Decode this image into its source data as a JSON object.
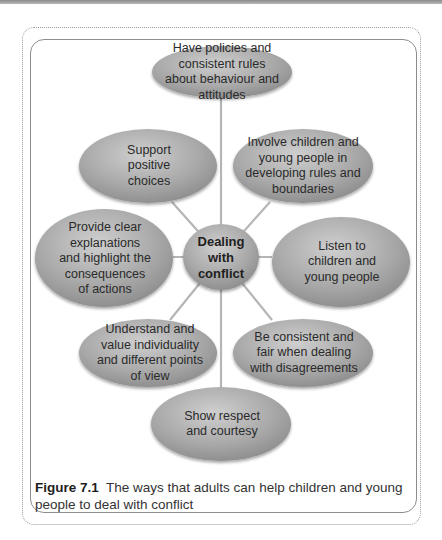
{
  "diagram": {
    "center": {
      "label": "Dealing with conflict"
    },
    "nodes": [
      {
        "id": "top",
        "label": "Have policies and consistent rules about behaviour and attitudes"
      },
      {
        "id": "upper-right",
        "label": "Involve children and young people in developing rules and boundaries"
      },
      {
        "id": "right",
        "label": "Listen to children and young people"
      },
      {
        "id": "lower-right",
        "label": "Be consistent and fair when dealing with disagreements"
      },
      {
        "id": "bottom",
        "label": "Show respect and courtesy"
      },
      {
        "id": "lower-left",
        "label": "Understand and value individuality and different points of view"
      },
      {
        "id": "left",
        "label": "Provide clear explanations and highlight the consequences of actions"
      },
      {
        "id": "upper-left",
        "label": "Support positive choices"
      }
    ],
    "colors": {
      "ellipse_fill": "#9e9e9e",
      "ellipse_highlight": "#c8c8c8",
      "connector": "#b0b0b0",
      "frame": "#8d8d8d"
    }
  },
  "caption": {
    "figure_label": "Figure 7.1",
    "text": "The ways that adults can help children and young people to deal with conflict"
  }
}
